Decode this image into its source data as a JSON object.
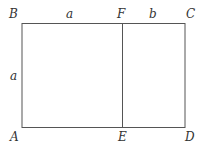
{
  "diagram": {
    "type": "golden-rectangle-construction",
    "points": {
      "B": "B",
      "F": "F",
      "C": "C",
      "A": "A",
      "E": "E",
      "D": "D"
    },
    "segments": {
      "top_left": "a",
      "top_right": "b",
      "left_side": "a"
    },
    "colors": {
      "line": "#555555",
      "text": "#333333",
      "background": "#ffffff"
    }
  }
}
